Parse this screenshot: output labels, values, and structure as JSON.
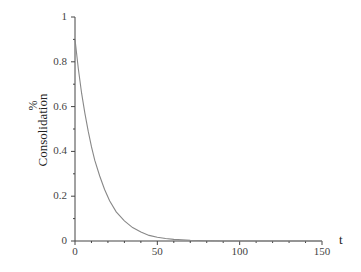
{
  "chart_data": {
    "type": "line",
    "title": "",
    "xlabel": "t",
    "ylabel": "% Consolidation",
    "ylabel_parts": {
      "unit": "%",
      "text": "Consolidation"
    },
    "xlim": [
      0,
      150
    ],
    "ylim": [
      0,
      1
    ],
    "x_ticks": [
      "0",
      "50",
      "100",
      "150"
    ],
    "y_ticks": [
      "0",
      "0.2",
      "0.4",
      "0.6",
      "0.8",
      "1"
    ],
    "grid": false,
    "legend": null,
    "series": [
      {
        "name": "Consolidation",
        "color": "#888888",
        "x": [
          0,
          2,
          4,
          6,
          8,
          10,
          12,
          15,
          18,
          21,
          25,
          30,
          35,
          40,
          45,
          50,
          55,
          60,
          70,
          80,
          90,
          100,
          120,
          150
        ],
        "y": [
          0.9,
          0.77,
          0.66,
          0.57,
          0.49,
          0.42,
          0.36,
          0.29,
          0.23,
          0.18,
          0.13,
          0.09,
          0.06,
          0.04,
          0.025,
          0.017,
          0.011,
          0.007,
          0.003,
          0.001,
          0.0,
          0.0,
          0.0,
          0.0
        ]
      }
    ]
  }
}
